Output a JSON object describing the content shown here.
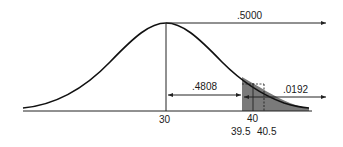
{
  "diagram": {
    "type": "normal-distribution-area",
    "mean_label": "30",
    "tick_labels": {
      "x40": "40",
      "lower_bound": "39.5",
      "upper_bound": "40.5"
    },
    "areas": {
      "right_half": ".5000",
      "mean_to_lower": ".4808",
      "upper_tail": ".0192"
    },
    "colors": {
      "curve": "#111111",
      "shade": "#7a7a7a",
      "axis": "#222222"
    }
  }
}
